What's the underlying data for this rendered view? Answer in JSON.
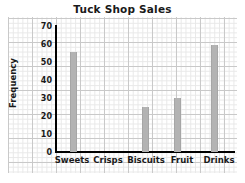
{
  "chart_data": {
    "type": "bar",
    "title": "Tuck Shop Sales",
    "xlabel": "",
    "ylabel": "Frequency",
    "categories": [
      "Sweets",
      "Crisps",
      "Biscuits",
      "Fruit",
      "Drinks"
    ],
    "values": [
      56,
      0,
      25,
      30,
      60
    ],
    "ylim": [
      0,
      70
    ],
    "ytick_labels": [
      "70",
      "60",
      "50",
      "40",
      "30",
      "20",
      "10",
      "0"
    ],
    "ytick_values": [
      70,
      60,
      50,
      40,
      30,
      20,
      10,
      0
    ],
    "ytick_step": 10,
    "grid": true,
    "grid_style": "graph-paper",
    "legend": false,
    "bar_color": "#b3b3b3",
    "axis_color": "#000000",
    "text_color": "#1a1a1a",
    "background_color": "#ffffff"
  }
}
